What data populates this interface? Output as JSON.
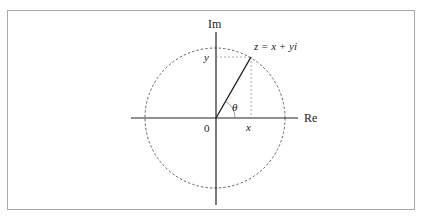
{
  "diagram": {
    "axes": {
      "real_label": "Re",
      "imaginary_label": "Im",
      "origin_label": "0"
    },
    "point": {
      "label": "z = x + yi",
      "x_label": "x",
      "y_label": "y",
      "angle_label": "θ"
    },
    "colors": {
      "stroke": "#222222",
      "dashed": "#555555",
      "frame": "#a8a8a8"
    }
  }
}
